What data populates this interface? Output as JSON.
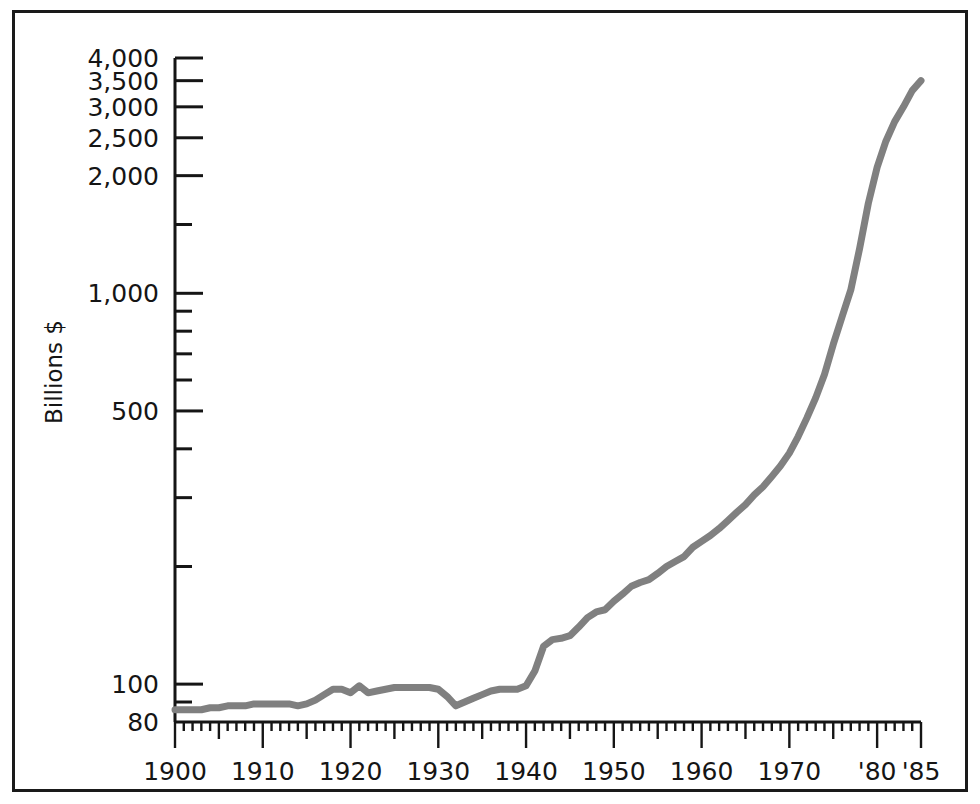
{
  "figure": {
    "border_color": "#1a1a1a",
    "background": "#ffffff"
  },
  "chart_data": {
    "type": "line",
    "title": "",
    "subtitle": "",
    "xlabel": "",
    "ylabel": "Billions $",
    "yscale": "log",
    "ylim": [
      80,
      4000
    ],
    "xlim": [
      1900,
      1985
    ],
    "grid": false,
    "legend": null,
    "series_color": "#808080",
    "y_ticks_major": [
      {
        "value": 4000,
        "label": "4,000"
      },
      {
        "value": 3500,
        "label": "3,500"
      },
      {
        "value": 3000,
        "label": "3,000"
      },
      {
        "value": 2500,
        "label": "2,500"
      },
      {
        "value": 2000,
        "label": "2,000"
      },
      {
        "value": 1000,
        "label": "1,000"
      },
      {
        "value": 500,
        "label": "500"
      },
      {
        "value": 100,
        "label": "100"
      },
      {
        "value": 80,
        "label": "80"
      }
    ],
    "y_ticks_minor": [
      1500,
      900,
      800,
      700,
      600,
      400,
      300,
      200,
      90
    ],
    "x_ticks_major": [
      {
        "value": 1900,
        "label": "1900"
      },
      {
        "value": 1910,
        "label": "1910"
      },
      {
        "value": 1920,
        "label": "1920"
      },
      {
        "value": 1930,
        "label": "1930"
      },
      {
        "value": 1940,
        "label": "1940"
      },
      {
        "value": 1950,
        "label": "1950"
      },
      {
        "value": 1960,
        "label": "1960"
      },
      {
        "value": 1970,
        "label": "1970"
      },
      {
        "value": 1980,
        "label": "'80"
      },
      {
        "value": 1985,
        "label": "'85"
      }
    ],
    "x_tick_interval_minor": 1,
    "x_tick_interval_medium": 5,
    "x": [
      1900,
      1901,
      1902,
      1903,
      1904,
      1905,
      1906,
      1907,
      1908,
      1909,
      1910,
      1911,
      1912,
      1913,
      1914,
      1915,
      1916,
      1917,
      1918,
      1919,
      1920,
      1921,
      1922,
      1923,
      1924,
      1925,
      1926,
      1927,
      1928,
      1929,
      1930,
      1931,
      1932,
      1933,
      1934,
      1935,
      1936,
      1937,
      1938,
      1939,
      1940,
      1941,
      1942,
      1943,
      1944,
      1945,
      1946,
      1947,
      1948,
      1949,
      1950,
      1951,
      1952,
      1953,
      1954,
      1955,
      1956,
      1957,
      1958,
      1959,
      1960,
      1961,
      1962,
      1963,
      1964,
      1965,
      1966,
      1967,
      1968,
      1969,
      1970,
      1971,
      1972,
      1973,
      1974,
      1975,
      1976,
      1977,
      1978,
      1979,
      1980,
      1981,
      1982,
      1983,
      1984,
      1985
    ],
    "values": [
      86,
      86,
      86,
      86,
      87,
      87,
      88,
      88,
      88,
      89,
      89,
      89,
      89,
      89,
      88,
      89,
      91,
      94,
      97,
      97,
      95,
      99,
      95,
      96,
      97,
      98,
      98,
      98,
      98,
      98,
      97,
      93,
      88,
      90,
      92,
      94,
      96,
      97,
      97,
      97,
      99,
      108,
      125,
      130,
      131,
      133,
      140,
      148,
      153,
      155,
      163,
      170,
      178,
      182,
      185,
      192,
      200,
      206,
      212,
      224,
      232,
      240,
      250,
      262,
      275,
      288,
      305,
      320,
      340,
      362,
      390,
      430,
      480,
      540,
      620,
      740,
      870,
      1020,
      1300,
      1700,
      2100,
      2450,
      2750,
      3000,
      3300,
      3500
    ]
  }
}
